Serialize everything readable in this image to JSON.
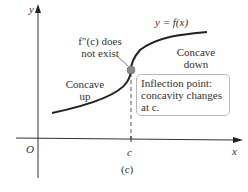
{
  "figure": {
    "caption": "(c)",
    "axes": {
      "x_label": "x",
      "y_label": "y",
      "origin_label": "O",
      "c_label": "c"
    },
    "curve_label": "y = f(x)",
    "annotations": {
      "derivative_note_line1": "f″(c) does",
      "derivative_note_line2": "not exist",
      "concave_up_line1": "Concave",
      "concave_up_line2": "up",
      "concave_down_line1": "Concave",
      "concave_down_line2": "down",
      "inflection_line1": "Inflection point:",
      "inflection_line2": "concavity changes",
      "inflection_line3": "at c."
    },
    "colors": {
      "curve": "#222222",
      "point": "#8a8a8a",
      "axis": "#333333",
      "box_border": "#b8b8b8"
    }
  }
}
